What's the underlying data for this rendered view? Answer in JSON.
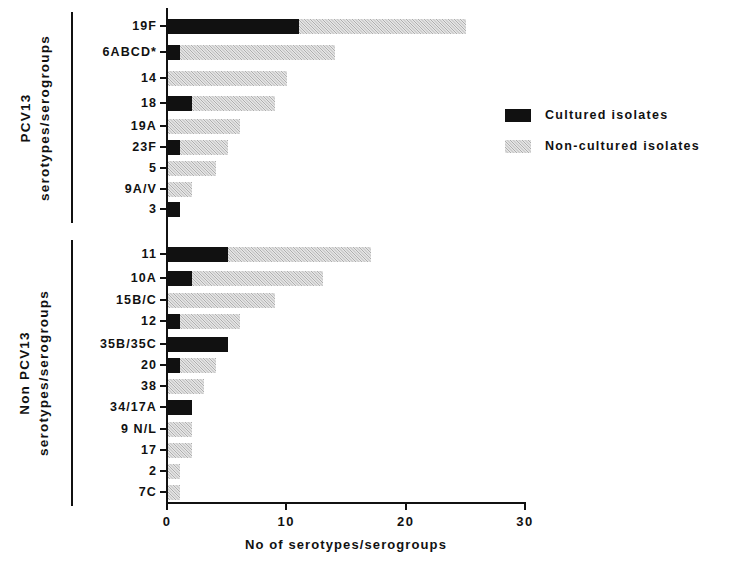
{
  "chart_data": {
    "type": "bar",
    "orientation": "horizontal",
    "stacked": true,
    "title": "",
    "xlabel": "No of serotypes/serogroups",
    "ylabel": "",
    "xlim": [
      0,
      30
    ],
    "xticks": [
      "0",
      "10",
      "20",
      "30"
    ],
    "grid": false,
    "legend_position": "right",
    "series": [
      {
        "name": "Cultured isolates",
        "color": "#111111",
        "values": [
          11,
          1,
          0,
          2,
          0,
          1,
          0,
          0,
          1,
          5,
          2,
          0,
          1,
          5,
          1,
          0,
          2,
          0,
          0,
          0,
          0
        ]
      },
      {
        "name": "Non-cultured isolates",
        "color": "#c9c9c9",
        "values": [
          14,
          13,
          10,
          7,
          6,
          4,
          4,
          2,
          0,
          12,
          11,
          9,
          5,
          0,
          3,
          3,
          0,
          2,
          2,
          1,
          1
        ]
      }
    ],
    "categories": [
      "19F",
      "6ABCD*",
      "14",
      "18",
      "19A",
      "23F",
      "5",
      "9A/V",
      "3",
      "11",
      "10A",
      "15B/C",
      "12",
      "35B/35C",
      "20",
      "38",
      "34/17A",
      "9 N/L",
      "17",
      "2",
      "7C"
    ],
    "totals": [
      25,
      14,
      10,
      9,
      6,
      5,
      4,
      2,
      1,
      17,
      13,
      9,
      6,
      5,
      4,
      3,
      2,
      2,
      2,
      1,
      1
    ],
    "groups": [
      {
        "label": "PCV13\nserotypes/serogroups",
        "line1": "PCV13",
        "line2": "serotypes/serogroups",
        "start": 0,
        "end": 8
      },
      {
        "label": "Non PCV13\nserotypes/serogroups",
        "line1": "Non PCV13",
        "line2": "serotypes/serogroups",
        "start": 9,
        "end": 20
      }
    ]
  },
  "legend": {
    "items": [
      {
        "label": "Cultured isolates",
        "color": "#111111"
      },
      {
        "label": "Non-cultured isolates",
        "color": "#c9c9c9"
      }
    ]
  },
  "axis": {
    "x_title": "No of serotypes/serogroups",
    "x_ticks": [
      "0",
      "10",
      "20",
      "30"
    ]
  }
}
